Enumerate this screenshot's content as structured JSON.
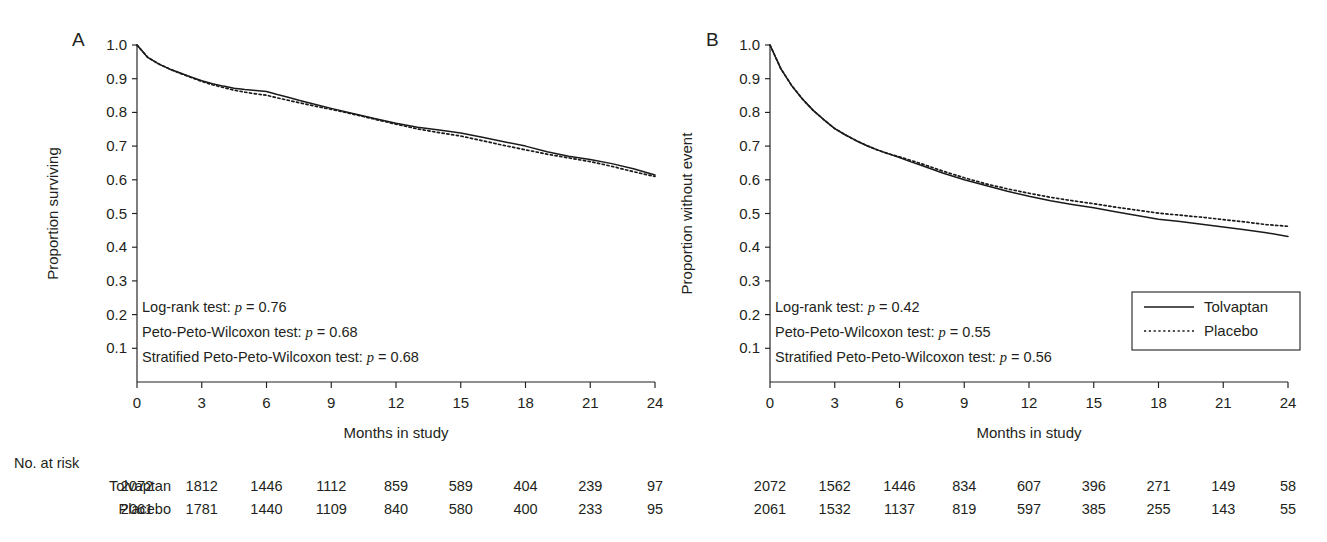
{
  "figure": {
    "panels": [
      {
        "letter": "A",
        "ylabel": "Proportion surviving",
        "xlabel": "Months in study",
        "annotations": [
          {
            "text": "Log-rank test: ",
            "italic": "p",
            "tail": " = 0.76"
          },
          {
            "text": "Peto-Peto-Wilcoxon test: ",
            "italic": "p",
            "tail": " = 0.68"
          },
          {
            "text": "Stratified Peto-Peto-Wilcoxon test: ",
            "italic": "p",
            "tail": " = 0.68"
          }
        ]
      },
      {
        "letter": "B",
        "ylabel": "Proportion without event",
        "xlabel": "Months in study",
        "annotations": [
          {
            "text": "Log-rank test: ",
            "italic": "p",
            "tail": " = 0.42"
          },
          {
            "text": "Peto-Peto-Wilcoxon test: ",
            "italic": "p",
            "tail": " = 0.55"
          },
          {
            "text": "Stratified Peto-Peto-Wilcoxon test: ",
            "italic": "p",
            "tail": " = 0.56"
          }
        ]
      }
    ],
    "legend": {
      "position": "right-panel-lower-right",
      "entries": [
        {
          "label": "Tolvaptan",
          "style": "solid"
        },
        {
          "label": "Placebo",
          "style": "dotted"
        }
      ]
    },
    "risk_table": {
      "heading": "No. at risk",
      "row_labels": [
        "Tolvaptan",
        "Placebo"
      ],
      "panel_a": {
        "Tolvaptan": [
          2072,
          1812,
          1446,
          1112,
          859,
          589,
          404,
          239,
          97
        ],
        "Placebo": [
          2061,
          1781,
          1440,
          1109,
          840,
          580,
          400,
          233,
          95
        ]
      },
      "panel_b": {
        "Tolvaptan": [
          2072,
          1562,
          1446,
          834,
          607,
          396,
          271,
          149,
          58
        ],
        "Placebo": [
          2061,
          1532,
          1137,
          819,
          597,
          385,
          255,
          143,
          55
        ]
      }
    }
  },
  "chart_data": [
    {
      "type": "line",
      "panel": "A",
      "title": "",
      "xlabel": "Months in study",
      "ylabel": "Proportion surviving",
      "xlim": [
        0,
        24
      ],
      "ylim": [
        0,
        1.0
      ],
      "xticks": [
        0,
        3,
        6,
        9,
        12,
        15,
        18,
        21,
        24
      ],
      "yticks": [
        0.1,
        0.2,
        0.3,
        0.4,
        0.5,
        0.6,
        0.7,
        0.8,
        0.9,
        1.0
      ],
      "grid": false,
      "legend": [
        "Tolvaptan",
        "Placebo"
      ],
      "x": [
        0,
        0.5,
        1,
        1.5,
        2,
        2.5,
        3,
        3.5,
        4,
        4.5,
        5,
        5.5,
        6,
        6.5,
        7,
        7.5,
        8,
        9,
        10,
        11,
        12,
        13,
        14,
        15,
        16,
        17,
        18,
        19,
        20,
        21,
        22,
        23,
        24
      ],
      "series": [
        {
          "name": "Tolvaptan",
          "style": "solid",
          "values": [
            1.0,
            0.963,
            0.944,
            0.929,
            0.917,
            0.905,
            0.894,
            0.885,
            0.878,
            0.872,
            0.868,
            0.865,
            0.862,
            0.853,
            0.845,
            0.836,
            0.828,
            0.812,
            0.797,
            0.782,
            0.768,
            0.756,
            0.748,
            0.739,
            0.726,
            0.713,
            0.7,
            0.683,
            0.67,
            0.66,
            0.648,
            0.633,
            0.614
          ]
        },
        {
          "name": "Placebo",
          "style": "dotted",
          "values": [
            1.0,
            0.963,
            0.944,
            0.929,
            0.916,
            0.904,
            0.892,
            0.882,
            0.874,
            0.866,
            0.86,
            0.855,
            0.851,
            0.843,
            0.836,
            0.829,
            0.822,
            0.809,
            0.795,
            0.78,
            0.765,
            0.751,
            0.74,
            0.73,
            0.716,
            0.702,
            0.689,
            0.676,
            0.665,
            0.654,
            0.64,
            0.624,
            0.61
          ]
        }
      ]
    },
    {
      "type": "line",
      "panel": "B",
      "title": "",
      "xlabel": "Months in study",
      "ylabel": "Proportion without event",
      "xlim": [
        0,
        24
      ],
      "ylim": [
        0,
        1.0
      ],
      "xticks": [
        0,
        3,
        6,
        9,
        12,
        15,
        18,
        21,
        24
      ],
      "yticks": [
        0.1,
        0.2,
        0.3,
        0.4,
        0.5,
        0.6,
        0.7,
        0.8,
        0.9,
        1.0
      ],
      "grid": false,
      "legend": [
        "Tolvaptan",
        "Placebo"
      ],
      "x": [
        0,
        0.5,
        1,
        1.5,
        2,
        2.5,
        3,
        3.5,
        4,
        4.5,
        5,
        5.5,
        6,
        6.5,
        7,
        8,
        9,
        10,
        11,
        12,
        13,
        14,
        15,
        16,
        17,
        18,
        19,
        20,
        21,
        22,
        23,
        24
      ],
      "series": [
        {
          "name": "Tolvaptan",
          "style": "solid",
          "values": [
            1.0,
            0.93,
            0.88,
            0.84,
            0.806,
            0.778,
            0.752,
            0.733,
            0.716,
            0.701,
            0.688,
            0.677,
            0.666,
            0.654,
            0.643,
            0.62,
            0.6,
            0.583,
            0.566,
            0.551,
            0.538,
            0.527,
            0.517,
            0.505,
            0.494,
            0.483,
            0.476,
            0.468,
            0.46,
            0.452,
            0.443,
            0.432
          ]
        },
        {
          "name": "Placebo",
          "style": "dotted",
          "values": [
            1.0,
            0.93,
            0.88,
            0.84,
            0.806,
            0.778,
            0.752,
            0.733,
            0.716,
            0.701,
            0.688,
            0.677,
            0.668,
            0.658,
            0.648,
            0.626,
            0.606,
            0.588,
            0.573,
            0.56,
            0.548,
            0.538,
            0.529,
            0.519,
            0.51,
            0.501,
            0.495,
            0.489,
            0.482,
            0.475,
            0.467,
            0.462
          ]
        }
      ]
    }
  ]
}
